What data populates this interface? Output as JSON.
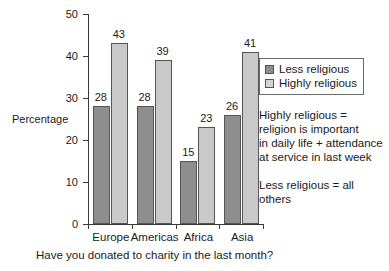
{
  "chart_data": {
    "type": "bar",
    "title": "",
    "xlabel": "Have you donated to charity in the last month?",
    "ylabel": "Percentage",
    "categories": [
      "Europe",
      "Americas",
      "Africa",
      "Asia"
    ],
    "series": [
      {
        "name": "Less religious",
        "values": [
          28,
          28,
          15,
          26
        ],
        "color": "#8e8e8e"
      },
      {
        "name": "Highly religious",
        "values": [
          43,
          39,
          23,
          41
        ],
        "color": "#c9c9c9"
      }
    ],
    "ylim": [
      0,
      50
    ],
    "yticks": [
      0,
      10,
      20,
      30,
      40,
      50
    ],
    "ytick_labels": [
      "0",
      "10",
      "20",
      "30",
      "40",
      "50"
    ],
    "grid": false,
    "legend_position": "right-top",
    "data_labels": true,
    "annotations": [
      "Highly religious =\nreligion is important\nin daily life + attendance\nat service in last week",
      "Less religious = all others"
    ]
  },
  "legend": {
    "items": [
      {
        "label": "Less religious"
      },
      {
        "label": "Highly religious"
      }
    ]
  },
  "axes": {
    "y_title": "Percentage",
    "x_title": "Have you donated to charity in the last month?"
  },
  "annotations": {
    "definition": "Highly religious =\nreligion is important\nin daily life + attendance\nat service in last week",
    "note": "Less religious = all others"
  }
}
